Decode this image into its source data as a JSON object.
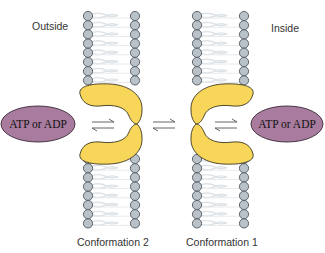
{
  "labels": {
    "outside": "Outside",
    "inside": "Inside",
    "conformation_left": "Conformation 2",
    "conformation_right": "Conformation 1"
  },
  "ligands": {
    "left": "ATP or ADP",
    "right": "ATP or ADP"
  },
  "arrows": {
    "left": "equilibrium",
    "center": "equilibrium",
    "right": "equilibrium"
  },
  "colors": {
    "protein_fill": "#f7d65a",
    "protein_stroke": "#3a3520",
    "ligand_fill": "#a97c9f",
    "ligand_stroke": "#3b2a38",
    "lipid_head_fill": "#b9c2c8",
    "lipid_head_stroke": "#505860",
    "lipid_tail": "#dde2e6"
  }
}
